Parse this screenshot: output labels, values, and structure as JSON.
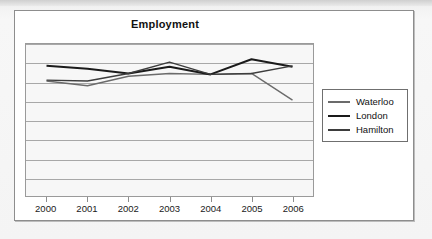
{
  "card": {
    "title": "Employment"
  },
  "legend": {
    "position": "right",
    "items": [
      {
        "label": "Waterloo",
        "color": "#6b6b6b"
      },
      {
        "label": "London",
        "color": "#1a1a1a"
      },
      {
        "label": "Hamilton",
        "color": "#3d3d3d"
      }
    ]
  },
  "chart_data": {
    "type": "line",
    "title": "Employment",
    "xlabel": "",
    "ylabel": "",
    "grid": true,
    "legend_position": "right",
    "categories": [
      "2000",
      "2001",
      "2002",
      "2003",
      "2004",
      "2005",
      "2006"
    ],
    "x": [
      2000,
      2001,
      2002,
      2003,
      2004,
      2005,
      2006
    ],
    "ylim": [
      0,
      8
    ],
    "yticks": [
      0,
      1,
      2,
      3,
      4,
      5,
      6,
      7,
      8
    ],
    "ytick_labels": [],
    "series": [
      {
        "name": "Waterloo",
        "color": "#6b6b6b",
        "values": [
          6.05,
          5.8,
          6.3,
          6.45,
          6.4,
          6.45,
          5.05
        ]
      },
      {
        "name": "London",
        "color": "#1a1a1a",
        "values": [
          6.85,
          6.7,
          6.45,
          6.8,
          6.4,
          7.2,
          6.8
        ]
      },
      {
        "name": "Hamilton",
        "color": "#3d3d3d",
        "values": [
          6.1,
          6.05,
          6.45,
          7.05,
          6.4,
          6.45,
          6.85
        ]
      }
    ]
  }
}
